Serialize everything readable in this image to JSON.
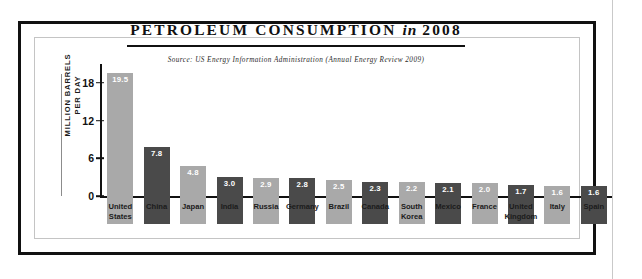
{
  "chart_data": {
    "type": "bar",
    "title": "PETROLEUM CONSUMPTION",
    "title_italic_part": "in",
    "title_year": "2008",
    "title_full": "PETROLEUM CONSUMPTION in 2008",
    "source": "Source: US Energy Information Administration (Annual Energy Review 2009)",
    "xlabel": "",
    "ylabel": "MILLION BARRELS\nPER DAY",
    "ylim": [
      0,
      21
    ],
    "yticks": [
      0,
      6,
      12,
      18
    ],
    "ytick_labels": [
      "0",
      "6",
      "12",
      "18"
    ],
    "grid": false,
    "legend": "none",
    "categories": [
      "United\nStates",
      "China",
      "Japan",
      "India",
      "Russia",
      "Germany",
      "Brazil",
      "Canada",
      "South\nKorea",
      "Mexico",
      "France",
      "United\nKingdom",
      "Italy",
      "Spain"
    ],
    "values": [
      19.5,
      7.8,
      4.8,
      3.0,
      2.9,
      2.8,
      2.5,
      2.3,
      2.2,
      2.1,
      2.0,
      1.7,
      1.6,
      1.6
    ],
    "value_labels": [
      "19.5",
      "7.8",
      "4.8",
      "3.0",
      "2.9",
      "2.8",
      "2.5",
      "2.3",
      "2.2",
      "2.1",
      "2.0",
      "1.7",
      "1.6",
      "1.6"
    ],
    "bar_colors": [
      "#a9a9a9",
      "#4a4a4a",
      "#a9a9a9",
      "#4a4a4a",
      "#a9a9a9",
      "#4a4a4a",
      "#a9a9a9",
      "#4a4a4a",
      "#a9a9a9",
      "#4a4a4a",
      "#a9a9a9",
      "#4a4a4a",
      "#a9a9a9",
      "#4a4a4a"
    ]
  },
  "colors": {
    "ink": "#111111",
    "bar_light": "#a9a9a9",
    "bar_dark": "#4a4a4a",
    "frame": "#111111",
    "inner_frame": "#c4c4c4",
    "background": "#ffffff"
  }
}
